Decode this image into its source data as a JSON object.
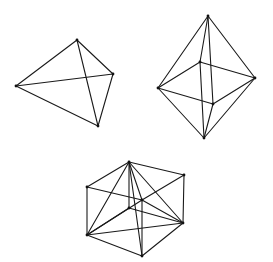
{
  "figures": [
    {
      "name": "tetrahedron",
      "vertices": {
        "a": [
          16,
          86
        ],
        "b": [
          77,
          40
        ],
        "c": [
          113,
          74
        ],
        "d": [
          98,
          126
        ]
      },
      "edges": [
        [
          "a",
          "b"
        ],
        [
          "b",
          "c"
        ],
        [
          "a",
          "c"
        ],
        [
          "b",
          "d"
        ],
        [
          "c",
          "d"
        ],
        [
          "a",
          "d"
        ]
      ]
    },
    {
      "name": "octahedron",
      "vertices": {
        "top": [
          208,
          16
        ],
        "left": [
          158,
          88
        ],
        "right": [
          255,
          78
        ],
        "back": [
          200,
          62
        ],
        "front": [
          213,
          104
        ],
        "bottom": [
          204,
          138
        ]
      },
      "edges": [
        [
          "top",
          "left"
        ],
        [
          "top",
          "right"
        ],
        [
          "top",
          "back"
        ],
        [
          "top",
          "front"
        ],
        [
          "left",
          "back"
        ],
        [
          "back",
          "right"
        ],
        [
          "right",
          "front"
        ],
        [
          "front",
          "left"
        ],
        [
          "bottom",
          "left"
        ],
        [
          "bottom",
          "right"
        ],
        [
          "bottom",
          "back"
        ],
        [
          "bottom",
          "front"
        ]
      ]
    },
    {
      "name": "cube-with-inscribed-tetrahedron",
      "vertices": {
        "A": [
          129,
          162
        ],
        "B": [
          184,
          175
        ],
        "C": [
          87,
          187
        ],
        "D": [
          142,
          200
        ],
        "H": [
          129,
          208
        ],
        "F": [
          183,
          223
        ],
        "E": [
          87,
          235
        ],
        "G": [
          142,
          256
        ]
      },
      "edges": [
        [
          "A",
          "B"
        ],
        [
          "A",
          "C"
        ],
        [
          "B",
          "D"
        ],
        [
          "C",
          "D"
        ],
        [
          "E",
          "G"
        ],
        [
          "G",
          "F"
        ],
        [
          "E",
          "H"
        ],
        [
          "H",
          "F"
        ],
        [
          "A",
          "H"
        ],
        [
          "B",
          "F"
        ],
        [
          "C",
          "E"
        ],
        [
          "D",
          "G"
        ],
        [
          "A",
          "E"
        ],
        [
          "A",
          "F"
        ],
        [
          "A",
          "G"
        ],
        [
          "A",
          "D"
        ],
        [
          "E",
          "F"
        ],
        [
          "E",
          "D"
        ],
        [
          "D",
          "F"
        ]
      ]
    }
  ]
}
